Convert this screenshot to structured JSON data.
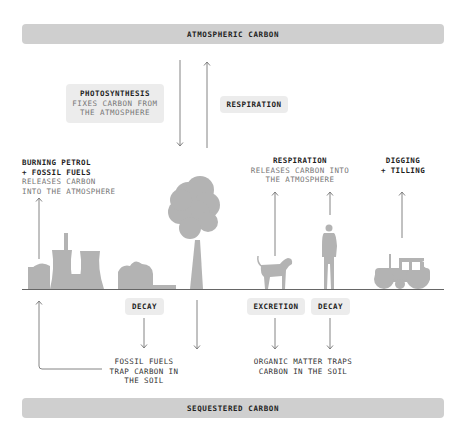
{
  "top_bar": {
    "label": "ATMOSPHERIC CARBON"
  },
  "bottom_bar": {
    "label": "SEQUESTERED CARBON"
  },
  "photosynthesis": {
    "title": "PHOTOSYNTHESIS",
    "line1": "FIXES CARBON FROM",
    "line2": "THE ATMOSPHERE"
  },
  "tree_respiration": {
    "title": "RESPIRATION"
  },
  "burning": {
    "title1": "BURNING PETROL",
    "title2": "+ FOSSIL FUELS",
    "line1": "RELEASES CARBON",
    "line2": "INTO THE ATMOSPHERE"
  },
  "animal_respiration": {
    "title": "RESPIRATION",
    "line1": "RELEASES CARBON INTO",
    "line2": "THE ATMOSPHERE"
  },
  "digging": {
    "title1": "DIGGING",
    "title2": "+ TILLING"
  },
  "decay_left": {
    "label": "DECAY"
  },
  "excretion": {
    "label": "EXCRETION"
  },
  "decay_right": {
    "label": "DECAY"
  },
  "fossil_trap": {
    "line1": "FOSSIL FUELS",
    "line2": "TRAP CARBON IN",
    "line3": "THE SOIL"
  },
  "organic_trap": {
    "line1": "ORGANIC MATTER TRAPS",
    "line2": "CARBON IN THE SOIL"
  },
  "colors": {
    "bar": "#cfcfcf",
    "pill": "#ececec",
    "silhouette": "#b3b3b3",
    "arrow": "#777777",
    "ground": "#666666"
  }
}
